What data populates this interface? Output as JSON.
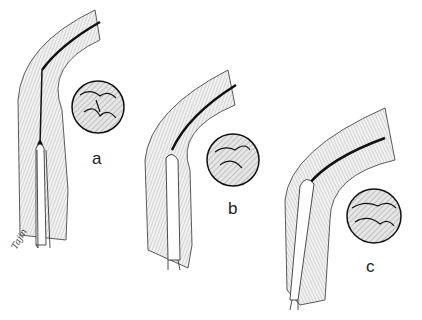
{
  "figure": {
    "panels": [
      {
        "id": "a",
        "label": "a"
      },
      {
        "id": "b",
        "label": "b"
      },
      {
        "id": "c",
        "label": "c"
      }
    ],
    "signature": "Tajin",
    "colors": {
      "ink": "#1a1a1a",
      "shade": "#d8d8d8",
      "paper": "#ffffff"
    }
  }
}
